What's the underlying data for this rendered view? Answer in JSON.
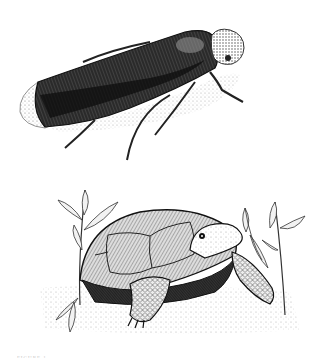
{
  "figure": {
    "panels": [
      {
        "id": "moth",
        "subject": "moth (dorsal-lateral view, wings folded)",
        "colors": {
          "ink": "#111111",
          "mid": "#555555",
          "light": "#a8a8a8",
          "paper": "#ffffff"
        }
      },
      {
        "id": "tortoise",
        "subject": "gopher tortoise among leafy plant stems on sandy ground",
        "colors": {
          "ink": "#111111",
          "mid": "#666666",
          "light": "#bbbbbb",
          "paper": "#ffffff"
        }
      }
    ],
    "caption": "FIGURE 1"
  }
}
